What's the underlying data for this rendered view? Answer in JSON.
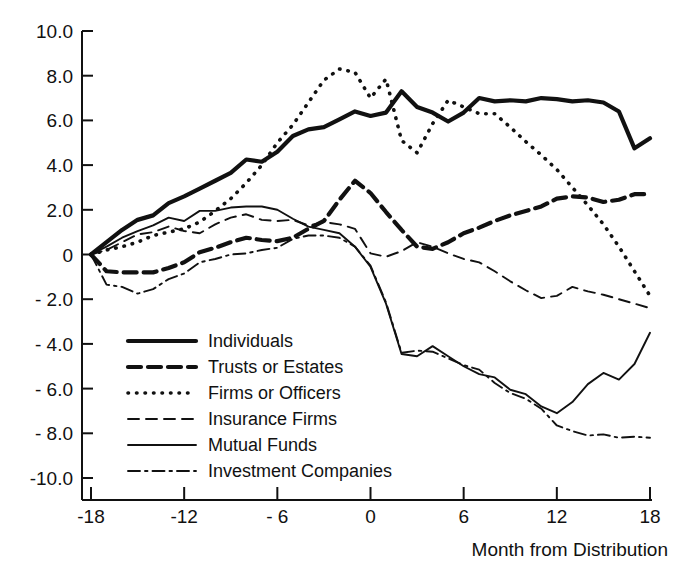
{
  "chart_data": {
    "type": "line",
    "title": "",
    "xlabel": "Month from Distribution",
    "ylabel": "",
    "xlim": [
      -18,
      18
    ],
    "ylim": [
      -10.0,
      10.0
    ],
    "grid": false,
    "legend_position": "inside-lower-left",
    "xticks": [
      -18,
      -12,
      -6,
      0,
      6,
      12,
      18
    ],
    "xtick_labels": [
      "-18",
      "-12",
      "- 6",
      "0",
      "6",
      "12",
      "18"
    ],
    "yticks": [
      10.0,
      8.0,
      6.0,
      4.0,
      2.0,
      0,
      -2.0,
      -4.0,
      -6.0,
      -8.0,
      -10.0
    ],
    "ytick_labels": [
      "10.0",
      "8.0",
      "6.0",
      "4.0",
      "2.0",
      "0",
      "- 2.0",
      "- 4.0",
      "- 6.0",
      "- 8.0",
      "-10.0"
    ],
    "x": [
      -18,
      -17,
      -16,
      -15,
      -14,
      -13,
      -12,
      -11,
      -10,
      -9,
      -8,
      -7,
      -6,
      -5,
      -4,
      -3,
      -2,
      -1,
      0,
      1,
      2,
      3,
      4,
      5,
      6,
      7,
      8,
      9,
      10,
      11,
      12,
      13,
      14,
      15,
      16,
      17,
      18
    ],
    "series": [
      {
        "name": "Individuals",
        "style": "thick-solid",
        "values": [
          0.0,
          0.55,
          1.1,
          1.55,
          1.75,
          2.3,
          2.6,
          2.95,
          3.3,
          3.65,
          4.25,
          4.15,
          4.6,
          5.3,
          5.6,
          5.7,
          6.05,
          6.4,
          6.2,
          6.35,
          7.3,
          6.6,
          6.35,
          5.95,
          6.35,
          7.0,
          6.85,
          6.9,
          6.85,
          7.0,
          6.95,
          6.85,
          6.9,
          6.8,
          6.4,
          4.75,
          5.2
        ]
      },
      {
        "name": "Trusts or Estates",
        "style": "thick-dashed",
        "values": [
          0.0,
          -0.75,
          -0.8,
          -0.8,
          -0.8,
          -0.6,
          -0.35,
          0.1,
          0.3,
          0.55,
          0.75,
          0.65,
          0.6,
          0.75,
          1.15,
          1.5,
          2.45,
          3.3,
          2.75,
          1.9,
          1.1,
          0.35,
          0.25,
          0.55,
          0.95,
          1.2,
          1.5,
          1.75,
          1.95,
          2.15,
          2.5,
          2.6,
          2.55,
          2.35,
          2.45,
          2.7,
          2.7
        ]
      },
      {
        "name": "Firms or Officers",
        "style": "dotted",
        "values": [
          0.0,
          0.2,
          0.35,
          0.55,
          0.85,
          1.0,
          1.15,
          1.45,
          1.95,
          2.5,
          3.2,
          4.0,
          5.0,
          5.8,
          6.8,
          7.8,
          8.3,
          8.15,
          7.0,
          7.85,
          5.1,
          4.55,
          5.85,
          6.9,
          6.6,
          6.3,
          6.3,
          5.7,
          5.05,
          4.45,
          3.8,
          3.0,
          2.2,
          1.35,
          0.35,
          -0.75,
          -1.85
        ]
      },
      {
        "name": "Insurance Firms",
        "style": "thin-dashed",
        "values": [
          0.0,
          0.2,
          0.55,
          0.9,
          1.0,
          1.25,
          1.05,
          0.95,
          1.35,
          1.65,
          1.8,
          1.55,
          1.5,
          1.55,
          1.3,
          1.45,
          1.35,
          1.15,
          0.05,
          -0.1,
          0.15,
          0.55,
          0.35,
          0.05,
          -0.2,
          -0.35,
          -0.75,
          -1.2,
          -1.6,
          -1.95,
          -1.85,
          -1.45,
          -1.65,
          -1.8,
          -2.0,
          -2.2,
          -2.4
        ]
      },
      {
        "name": "Mutual Funds",
        "style": "thin-solid",
        "values": [
          0.0,
          0.35,
          0.75,
          1.05,
          1.3,
          1.65,
          1.5,
          1.95,
          1.95,
          2.1,
          2.15,
          2.15,
          2.0,
          1.6,
          1.25,
          1.1,
          0.95,
          0.35,
          -0.55,
          -2.2,
          -4.45,
          -4.55,
          -4.1,
          -4.55,
          -5.0,
          -5.35,
          -5.5,
          -6.05,
          -6.25,
          -6.8,
          -7.1,
          -6.6,
          -5.8,
          -5.3,
          -5.6,
          -4.9,
          -3.5
        ]
      },
      {
        "name": "Investment Companies",
        "style": "dash-dot",
        "values": [
          0.0,
          -1.35,
          -1.45,
          -1.75,
          -1.55,
          -1.1,
          -0.85,
          -0.35,
          -0.2,
          0.0,
          0.05,
          0.2,
          0.3,
          0.7,
          0.85,
          0.85,
          0.75,
          0.35,
          -0.5,
          -2.15,
          -4.4,
          -4.3,
          -4.35,
          -4.65,
          -4.95,
          -5.15,
          -5.75,
          -6.2,
          -6.45,
          -6.9,
          -7.65,
          -7.9,
          -8.1,
          -8.05,
          -8.2,
          -8.15,
          -8.2
        ]
      }
    ]
  },
  "legend": {
    "entries": [
      {
        "label": "Individuals",
        "style": "thick-solid"
      },
      {
        "label": "Trusts or Estates",
        "style": "thick-dashed"
      },
      {
        "label": "Firms or Officers",
        "style": "dotted"
      },
      {
        "label": "Insurance Firms",
        "style": "thin-dashed"
      },
      {
        "label": "Mutual Funds",
        "style": "thin-solid"
      },
      {
        "label": "Investment Companies",
        "style": "dash-dot"
      }
    ]
  },
  "colors": {
    "ink": "#111111",
    "background": "#ffffff"
  }
}
